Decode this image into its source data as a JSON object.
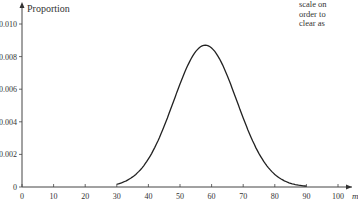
{
  "side_text": {
    "lines": [
      "scale on",
      "order to",
      "clear as"
    ]
  },
  "chart_data": {
    "type": "line",
    "title": "",
    "xlabel": "m",
    "ylabel": "Proportion",
    "xlim": [
      0,
      100
    ],
    "ylim": [
      0,
      0.01
    ],
    "x_ticks": [
      "0",
      "10",
      "20",
      "30",
      "40",
      "50",
      "60",
      "70",
      "80",
      "90",
      "100"
    ],
    "y_ticks": [
      "0",
      "0.002",
      "0.004",
      "0.006",
      "0.008",
      "0.010"
    ],
    "grid": false,
    "legend": null,
    "series": [
      {
        "name": "Proportion",
        "distribution": "normal-shaped curve",
        "peak_x": 58,
        "peak_y": 0.0087,
        "sd_approx": 10,
        "x": [
          30,
          35,
          40,
          45,
          50,
          55,
          58,
          60,
          65,
          70,
          75,
          80,
          85,
          90
        ],
        "y": [
          0.0002,
          0.0006,
          0.0017,
          0.0037,
          0.0063,
          0.0083,
          0.0087,
          0.0086,
          0.0068,
          0.0042,
          0.002,
          0.0008,
          0.0002,
          0.0001
        ]
      }
    ]
  }
}
